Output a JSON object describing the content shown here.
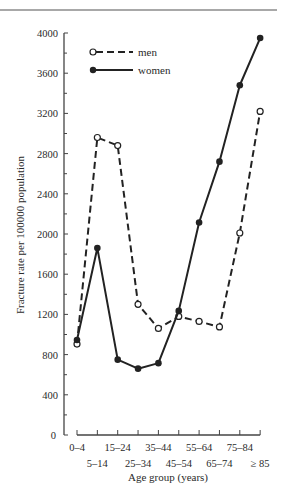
{
  "chart_data": {
    "type": "line",
    "title": "",
    "xlabel": "Age group (years)",
    "ylabel": "Fracture rate per 100000 population",
    "ylim": [
      0,
      4000
    ],
    "yticks": [
      0,
      400,
      800,
      1200,
      1600,
      2000,
      2400,
      2800,
      3200,
      3600,
      4000
    ],
    "grid": false,
    "legend_position": "upper-left",
    "categories": [
      "0–4",
      "5–14",
      "15–24",
      "25–34",
      "35–44",
      "45–54",
      "55–64",
      "65–74",
      "75–84",
      "≥ 85"
    ],
    "series": [
      {
        "name": "men",
        "style": "dashed",
        "marker": "open-circle",
        "values": [
          905,
          2960,
          2880,
          1300,
          1060,
          1180,
          1130,
          1075,
          2010,
          3220
        ]
      },
      {
        "name": "women",
        "style": "solid",
        "marker": "filled-circle",
        "values": [
          945,
          1860,
          750,
          660,
          715,
          1235,
          2115,
          2720,
          3480,
          3950
        ]
      }
    ]
  },
  "labels": {
    "xlabel": "Age group (years)",
    "ylabel": "Fracture rate per 100000 population",
    "legend_men": "men",
    "legend_women": "women"
  }
}
